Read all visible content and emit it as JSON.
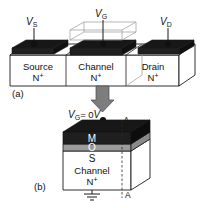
{
  "figure": {
    "caption_a": "(a)",
    "caption_b": "(b)"
  },
  "panel_a": {
    "terminals": [
      {
        "name": "source-terminal",
        "symbol": "V",
        "subscript": "S"
      },
      {
        "name": "gate-terminal",
        "symbol": "V",
        "subscript": "G"
      },
      {
        "name": "drain-terminal",
        "symbol": "V",
        "subscript": "D"
      }
    ],
    "regions": [
      {
        "name": "source-region",
        "line1": "Source",
        "line2": "N",
        "line2_sup": "+"
      },
      {
        "name": "channel-region",
        "line1": "Channel",
        "line2": "N",
        "line2_sup": "+"
      },
      {
        "name": "drain-region",
        "line1": "Drain",
        "line2": "N",
        "line2_sup": "+"
      }
    ]
  },
  "panel_b": {
    "gate_bias": {
      "symbol": "V",
      "subscript": "G",
      "equals": "= 0",
      "unit": "V"
    },
    "cut_label_top": "A",
    "cut_label_bottom": "A",
    "layers": [
      {
        "name": "metal-layer",
        "label": "M"
      },
      {
        "name": "oxide-layer",
        "label": "O"
      },
      {
        "name": "semiconductor-layer",
        "label": "S"
      }
    ],
    "body_line1": "Channel",
    "body_line2": "N",
    "body_line2_sup": "+",
    "ground_symbol": "ground-icon"
  },
  "colors": {
    "metal_black": "#1a1a1a",
    "oxide_gray": "#9b9b9b",
    "body_white": "#ffffff",
    "outline": "#1a1a1a",
    "wire_gray": "#a8a8a8",
    "arrow_gray": "#7a7a7a"
  }
}
